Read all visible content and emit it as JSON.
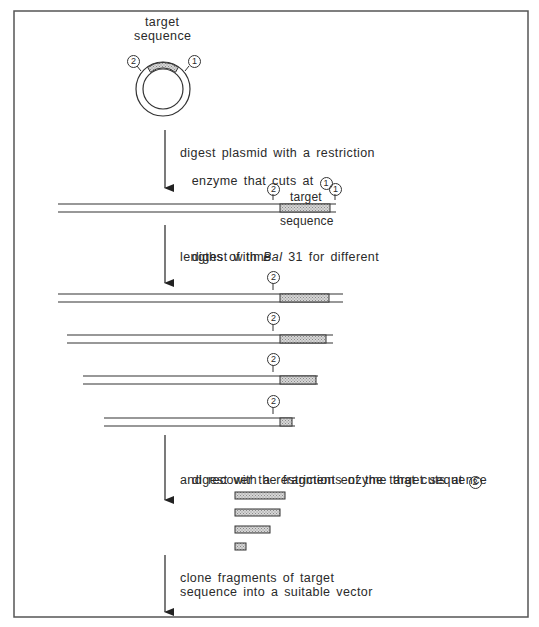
{
  "figure": {
    "plasmid": {
      "label_line1": "target",
      "label_line2": "sequence",
      "site_left": "2",
      "site_right": "1"
    },
    "steps": [
      {
        "line1": "digest plasmid with a restriction",
        "line2_prefix": "enzyme that cuts at",
        "site": "1"
      },
      {
        "line1_prefix": "digest with",
        "line1_italic": "Bal",
        "line1_suffix": "31 for different",
        "line2": "lengths of time"
      },
      {
        "line1_prefix": "digest with a restriction enzyme that cuts at",
        "site": "2",
        "line2": "and recover the fragments of the target sequence"
      },
      {
        "line1": "clone fragments of target",
        "line2": "sequence into a suitable vector"
      }
    ],
    "linear": {
      "label_top": "target",
      "label_bottom": "sequence",
      "site_left": "2",
      "site_right": "1"
    },
    "deletion_rows_site": "2",
    "deletion_rows": [
      {
        "left": 58,
        "right": 343,
        "box_end": 329,
        "y": 294
      },
      {
        "left": 67,
        "right": 333,
        "box_end": 326,
        "y": 335
      },
      {
        "left": 83,
        "right": 318,
        "box_end": 316,
        "y": 376
      },
      {
        "left": 104,
        "right": 295,
        "box_end": 292,
        "y": 418
      }
    ],
    "fragments": [
      {
        "width": 50
      },
      {
        "width": 45
      },
      {
        "width": 35
      },
      {
        "width": 11
      }
    ],
    "colors": {
      "line": "#333333",
      "hatch": "#bdbdbd",
      "frame": "#555555"
    }
  }
}
